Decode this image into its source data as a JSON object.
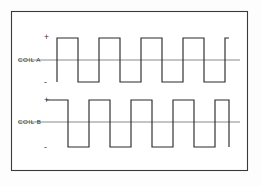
{
  "figure": {
    "background_color": "#fdfdfd",
    "frame_color": "#3a3a3a",
    "trace_color": "#2b2b2b",
    "baseline_color": "#6d6d6d",
    "frame": {
      "x": 11,
      "y": 11,
      "width": 236,
      "height": 159
    }
  },
  "chart_data": {
    "type": "line",
    "title": "",
    "xlabel": "",
    "ylabel": "",
    "grid": false,
    "legend_position": "left-inline",
    "x_axis": {
      "range": [
        57,
        228
      ],
      "unit": "px",
      "ticks": [],
      "tick_labels": []
    },
    "y_axis": {
      "levels": [
        "+",
        "-"
      ],
      "tick_labels": [
        "+",
        "-"
      ]
    },
    "series": [
      {
        "name": "COIL A",
        "label": "COIL A",
        "plus_label": "+",
        "minus_label": "-",
        "baseline_y": 60,
        "high_y": 38,
        "low_y": 82,
        "baseline_x_start": 18,
        "baseline_x_end": 240,
        "start_x": 57,
        "end_x": 229,
        "start_level": "+",
        "transitions_x": [
          57,
          78,
          99,
          120,
          141,
          162,
          183,
          204,
          225
        ],
        "values": [
          1,
          0,
          1,
          0,
          1,
          0,
          1,
          0,
          1
        ],
        "points": [
          [
            57,
            82
          ],
          [
            57,
            38
          ],
          [
            78,
            38
          ],
          [
            78,
            82
          ],
          [
            99,
            82
          ],
          [
            99,
            38
          ],
          [
            120,
            38
          ],
          [
            120,
            82
          ],
          [
            141,
            82
          ],
          [
            141,
            38
          ],
          [
            162,
            38
          ],
          [
            162,
            82
          ],
          [
            183,
            82
          ],
          [
            183,
            38
          ],
          [
            204,
            38
          ],
          [
            204,
            82
          ],
          [
            225,
            82
          ],
          [
            225,
            38
          ],
          [
            229,
            38
          ]
        ]
      },
      {
        "name": "COIL B",
        "label": "COIL B",
        "plus_label": "+",
        "minus_label": "-",
        "baseline_y": 122,
        "high_y": 100,
        "low_y": 147,
        "baseline_x_start": 18,
        "baseline_x_end": 240,
        "start_x": 46,
        "end_x": 229,
        "start_level": "+",
        "transitions_x": [
          68,
          89,
          110,
          131,
          152,
          173,
          194,
          215
        ],
        "values": [
          1,
          0,
          1,
          0,
          1,
          0,
          1,
          0,
          1
        ],
        "points": [
          [
            46,
            100
          ],
          [
            68,
            100
          ],
          [
            68,
            147
          ],
          [
            89,
            147
          ],
          [
            89,
            100
          ],
          [
            110,
            100
          ],
          [
            110,
            147
          ],
          [
            131,
            147
          ],
          [
            131,
            100
          ],
          [
            152,
            100
          ],
          [
            152,
            147
          ],
          [
            173,
            147
          ],
          [
            173,
            100
          ],
          [
            194,
            100
          ],
          [
            194,
            147
          ],
          [
            215,
            147
          ],
          [
            215,
            100
          ],
          [
            229,
            100
          ],
          [
            229,
            147
          ]
        ]
      }
    ]
  }
}
